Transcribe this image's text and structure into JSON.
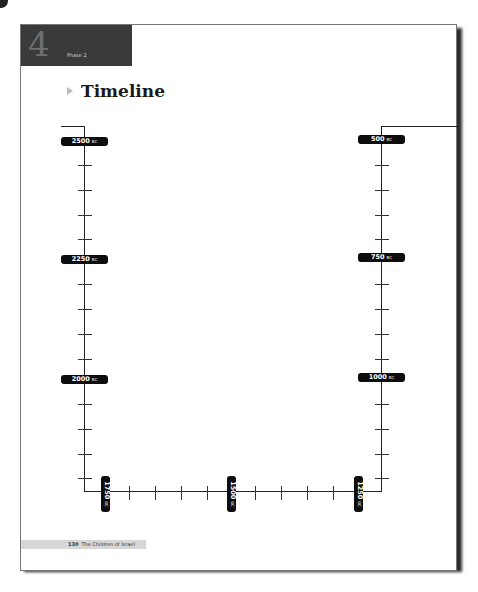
{
  "header": {
    "chapter_number": "4",
    "phase_label": "Phase 2",
    "title": "Timeline",
    "title_marker_icon": "triangle-right-icon"
  },
  "timeline": {
    "left_axis_labels": [
      {
        "year": "2500",
        "era": "BC"
      },
      {
        "year": "2250",
        "era": "BC"
      },
      {
        "year": "2000",
        "era": "BC"
      }
    ],
    "bottom_axis_labels": [
      {
        "year": "1750",
        "era": "BC"
      },
      {
        "year": "1500",
        "era": "BC"
      },
      {
        "year": "1250",
        "era": "BC"
      }
    ],
    "right_axis_labels": [
      {
        "year": "500",
        "era": "BC"
      },
      {
        "year": "750",
        "era": "BC"
      },
      {
        "year": "1000",
        "era": "BC"
      }
    ]
  },
  "footer": {
    "page_number": "130",
    "book_title": "The Children of Israel"
  },
  "colors": {
    "chapter_box": "#3a3a3a",
    "label_bg": "#0d0d0d",
    "footer_bar": "#d6d6d6"
  }
}
